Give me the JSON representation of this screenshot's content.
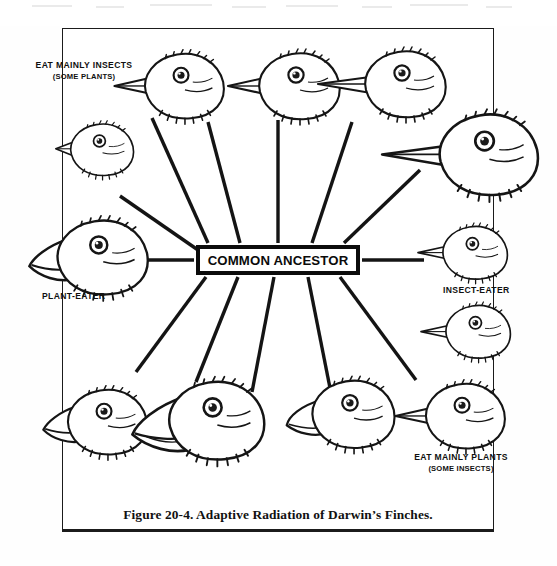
{
  "figure": {
    "caption": "Figure 20-4.  Adaptive Radiation of Darwin’s Finches.",
    "center_node": "COMMON ANCESTOR",
    "frame_color": "#1b1b1b",
    "ink_color": "#111111",
    "background_color": "#ffffff"
  },
  "labels": [
    {
      "id": "eat-mainly-insects",
      "line1": "EAT MAINLY INSECTS",
      "line2": "(SOME PLANTS)",
      "position": "top-left"
    },
    {
      "id": "plant-eater",
      "line1": "PLANT-EATER",
      "line2": "",
      "position": "left"
    },
    {
      "id": "insect-eater",
      "line1": "INSECT-EATER",
      "line2": "",
      "position": "right"
    },
    {
      "id": "eat-mainly-plants",
      "line1": "EAT MAINLY PLANTS",
      "line2": "(SOME INSECTS)",
      "position": "bottom-right"
    }
  ],
  "diagram": {
    "type": "radial-relationship-diagram",
    "center_label": "COMMON ANCESTOR",
    "spoke_count": 12,
    "finch_head_count": 12,
    "finch_heads": [
      {
        "id": "finch-01",
        "facing": "left",
        "beak": "slender-pointed",
        "quadrant": "top",
        "size": "medium"
      },
      {
        "id": "finch-02",
        "facing": "left",
        "beak": "medium-pointed",
        "quadrant": "top",
        "size": "medium"
      },
      {
        "id": "finch-03",
        "facing": "left",
        "beak": "long-slender",
        "quadrant": "top",
        "size": "medium"
      },
      {
        "id": "finch-04",
        "facing": "left",
        "beak": "long-probing",
        "quadrant": "top-right",
        "size": "large"
      },
      {
        "id": "finch-05",
        "facing": "left",
        "beak": "short-conical",
        "quadrant": "left-upper",
        "size": "small"
      },
      {
        "id": "finch-06",
        "facing": "left",
        "beak": "heavy-crushing",
        "quadrant": "left",
        "size": "large"
      },
      {
        "id": "finch-07",
        "facing": "left",
        "beak": "short-stout",
        "quadrant": "bottom-left",
        "size": "medium"
      },
      {
        "id": "finch-08",
        "facing": "left",
        "beak": "deep-heavy",
        "quadrant": "bottom",
        "size": "large"
      },
      {
        "id": "finch-09",
        "facing": "left",
        "beak": "broad-deep",
        "quadrant": "bottom",
        "size": "medium"
      },
      {
        "id": "finch-10",
        "facing": "left",
        "beak": "sharp-pointed",
        "quadrant": "bottom-right",
        "size": "medium"
      },
      {
        "id": "finch-11",
        "facing": "left",
        "beak": "fine-pointed",
        "quadrant": "right-lower",
        "size": "small"
      },
      {
        "id": "finch-12",
        "facing": "left",
        "beak": "slender-probing",
        "quadrant": "right",
        "size": "small"
      }
    ]
  }
}
